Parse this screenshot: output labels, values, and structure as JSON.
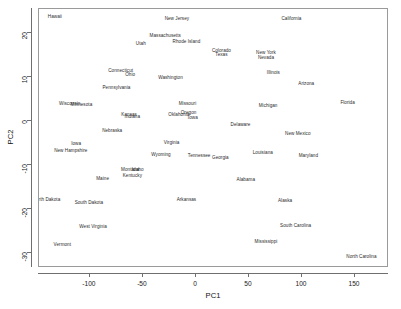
{
  "chart_data": {
    "type": "scatter",
    "title": "",
    "xlabel": "PC1",
    "ylabel": "PC2",
    "xlim": [
      -148,
      182
    ],
    "ylim": [
      -33.5,
      25.5
    ],
    "xticks": [
      -100,
      -50,
      0,
      50,
      100,
      150
    ],
    "yticks": [
      20,
      10,
      0,
      -10,
      -20,
      -30
    ],
    "xtick_labels": [
      "-100",
      "-50",
      "0",
      "50",
      "100",
      "150"
    ],
    "ytick_labels": [
      "20",
      "10",
      "0",
      "-10",
      "-20",
      "-30"
    ],
    "grid": false,
    "legend": null,
    "marker": "text-label",
    "points": [
      {
        "label": "Hawaii",
        "x": -133,
        "y": 23.8
      },
      {
        "label": "New Jersey",
        "x": -18,
        "y": 23.5
      },
      {
        "label": "California",
        "x": 90,
        "y": 23.5
      },
      {
        "label": "Massachusetts",
        "x": -29,
        "y": 19.6
      },
      {
        "label": "Rhode Island",
        "x": -9,
        "y": 18.2
      },
      {
        "label": "Utah",
        "x": -52,
        "y": 17.8
      },
      {
        "label": "Colorado",
        "x": 24,
        "y": 16.2
      },
      {
        "label": "Texas",
        "x": 24,
        "y": 15.2
      },
      {
        "label": "New York",
        "x": 66,
        "y": 15.6
      },
      {
        "label": "Nevada",
        "x": 66,
        "y": 14.6
      },
      {
        "label": "Connecticut",
        "x": -71,
        "y": 11.5
      },
      {
        "label": "Ohio",
        "x": -62,
        "y": 10.6
      },
      {
        "label": "Illinois",
        "x": 73,
        "y": 11.1
      },
      {
        "label": "Washington",
        "x": -24,
        "y": 9.9
      },
      {
        "label": "Arizona",
        "x": 104,
        "y": 8.6
      },
      {
        "label": "Pennsylvania",
        "x": -75,
        "y": 7.7
      },
      {
        "label": "Wisconsin",
        "x": -119,
        "y": 4.2
      },
      {
        "label": "Minnesota",
        "x": -108,
        "y": 3.8
      },
      {
        "label": "Missouri",
        "x": -8,
        "y": 4.1
      },
      {
        "label": "Michigan",
        "x": 68,
        "y": 3.7
      },
      {
        "label": "Florida",
        "x": 143,
        "y": 4.3
      },
      {
        "label": "Kansas",
        "x": -63,
        "y": 1.5
      },
      {
        "label": "Indiana",
        "x": -60,
        "y": 1.2
      },
      {
        "label": "Oklahoma",
        "x": -16,
        "y": 1.5
      },
      {
        "label": "Oregon",
        "x": -7,
        "y": 2.1
      },
      {
        "label": "Iowa",
        "x": -3,
        "y": 1.0
      },
      {
        "label": "Nebraska",
        "x": -79,
        "y": -2.1
      },
      {
        "label": "Delaware",
        "x": 42,
        "y": -0.8
      },
      {
        "label": "New Mexico",
        "x": 96,
        "y": -2.8
      },
      {
        "label": "Virginia",
        "x": -23,
        "y": -4.8
      },
      {
        "label": "Iowa2",
        "x": -113,
        "y": -5.0
      },
      {
        "label": "New Hampshire",
        "x": -118,
        "y": -6.6
      },
      {
        "label": "Wyoming",
        "x": -33,
        "y": -7.6
      },
      {
        "label": "Tennessee",
        "x": 3,
        "y": -7.8
      },
      {
        "label": "Georgia",
        "x": 23,
        "y": -8.3
      },
      {
        "label": "Louisiana",
        "x": 63,
        "y": -7.0
      },
      {
        "label": "Maryland",
        "x": 106,
        "y": -7.8
      },
      {
        "label": "Montana",
        "x": -62,
        "y": -11.0
      },
      {
        "label": "Idaho",
        "x": -55,
        "y": -11.0
      },
      {
        "label": "Kentucky",
        "x": -60,
        "y": -12.4
      },
      {
        "label": "Maine",
        "x": -88,
        "y": -13.0
      },
      {
        "label": "Alabama",
        "x": 47,
        "y": -13.2
      },
      {
        "label": "North Dakota",
        "x": -141,
        "y": -17.8
      },
      {
        "label": "South Dakota",
        "x": -101,
        "y": -18.4
      },
      {
        "label": "Arkansas",
        "x": -9,
        "y": -17.8
      },
      {
        "label": "Alaska",
        "x": 84,
        "y": -18.0
      },
      {
        "label": "West Virginia",
        "x": -97,
        "y": -24.0
      },
      {
        "label": "South Carolina",
        "x": 94,
        "y": -23.6
      },
      {
        "label": "Vermont",
        "x": -126,
        "y": -28.0
      },
      {
        "label": "Mississippi",
        "x": 66,
        "y": -27.4
      },
      {
        "label": "North Carolina",
        "x": 156,
        "y": -30.8
      }
    ]
  }
}
